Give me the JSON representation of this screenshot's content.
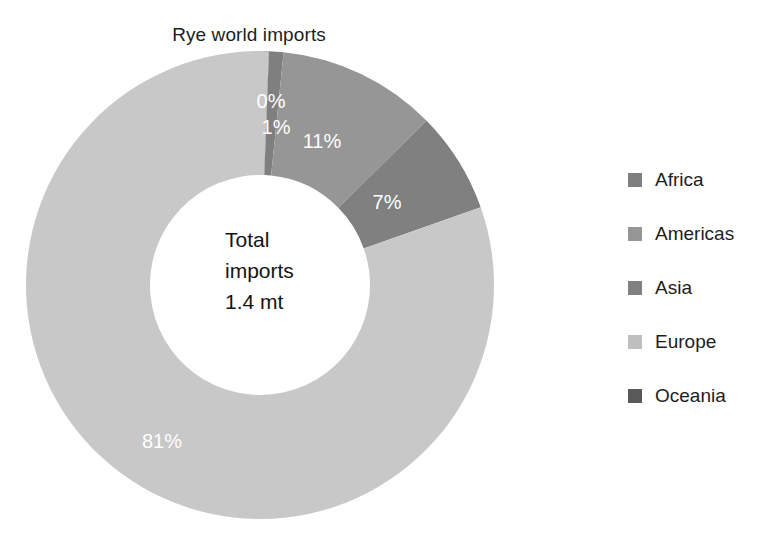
{
  "chart_data": {
    "type": "pie",
    "variant": "donut",
    "title": "Rye world imports",
    "xlabel": "",
    "ylabel": "",
    "categories": [
      "Oceania",
      "Africa",
      "Americas",
      "Asia",
      "Europe"
    ],
    "values": [
      0,
      1,
      11,
      7,
      81
    ],
    "value_unit": "%",
    "data_labels": [
      "0%",
      "1%",
      "11%",
      "7%",
      "81%"
    ],
    "slice_colors": [
      "#595959",
      "#7f7f7f",
      "#969696",
      "#808080",
      "#c8c8c8"
    ],
    "start_angle_deg": 0,
    "direction": "clockwise",
    "center_annotation": {
      "line1": "Total",
      "line2": "imports",
      "line3": "1.4 mt"
    },
    "legend": {
      "position": "right",
      "entries": [
        {
          "label": "Africa",
          "color": "#7f7f7f"
        },
        {
          "label": "Americas",
          "color": "#969696"
        },
        {
          "label": "Asia",
          "color": "#808080"
        },
        {
          "label": "Europe",
          "color": "#bfbfbf"
        },
        {
          "label": "Oceania",
          "color": "#595959"
        }
      ]
    },
    "grid": false,
    "background_color": "#ffffff",
    "label_text_color": "#ffffff"
  }
}
